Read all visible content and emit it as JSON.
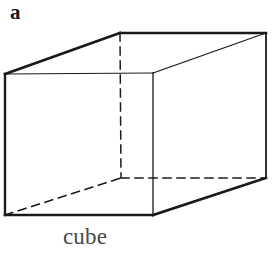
{
  "figure": {
    "panel_label": "a",
    "caption": "cube",
    "background_color": "#ffffff",
    "ink_color": "#1a1a1a",
    "caption_color": "#4a4a4a",
    "width": 273,
    "height": 258
  },
  "shape": {
    "name": "cube",
    "projection": "oblique-wireframe",
    "vertices": {
      "front_top_left": [
        5,
        74
      ],
      "front_top_right": [
        153,
        73
      ],
      "front_bottom_left": [
        5,
        215
      ],
      "front_bottom_right": [
        153,
        215
      ],
      "back_top_left": [
        120,
        33
      ],
      "back_top_right": [
        266,
        33
      ],
      "back_bottom_left": [
        121,
        178
      ],
      "back_bottom_right": [
        266,
        178
      ]
    },
    "edges": [
      {
        "name": "front-top",
        "from": "front_top_left",
        "to": "front_top_right",
        "style": "solid",
        "weight": 1.1
      },
      {
        "name": "front-left",
        "from": "front_top_left",
        "to": "front_bottom_left",
        "style": "solid",
        "weight": 2.4
      },
      {
        "name": "front-right",
        "from": "front_top_right",
        "to": "front_bottom_right",
        "style": "solid",
        "weight": 1.3
      },
      {
        "name": "front-bottom",
        "from": "front_bottom_left",
        "to": "front_bottom_right",
        "style": "solid",
        "weight": 2.6
      },
      {
        "name": "top-left-receding",
        "from": "front_top_left",
        "to": "back_top_left",
        "style": "solid",
        "weight": 2.6
      },
      {
        "name": "top-back",
        "from": "back_top_left",
        "to": "back_top_right",
        "style": "solid",
        "weight": 2.6
      },
      {
        "name": "top-right-receding",
        "from": "front_top_right",
        "to": "back_top_right",
        "style": "solid",
        "weight": 1.1
      },
      {
        "name": "back-right-vertical",
        "from": "back_top_right",
        "to": "back_bottom_right",
        "style": "solid",
        "weight": 1.8
      },
      {
        "name": "bottom-right-receding",
        "from": "front_bottom_right",
        "to": "back_bottom_right",
        "style": "solid",
        "weight": 2.6
      },
      {
        "name": "hidden-back-vertical",
        "from": "back_top_left",
        "to": "back_bottom_left",
        "style": "dashed",
        "weight": 1.5
      },
      {
        "name": "hidden-bottom-back",
        "from": "back_bottom_left",
        "to": "back_bottom_right",
        "style": "dashed",
        "weight": 1.5
      },
      {
        "name": "hidden-bottom-left",
        "from": "front_bottom_left",
        "to": "back_bottom_left",
        "style": "dashed",
        "weight": 1.5
      }
    ]
  }
}
